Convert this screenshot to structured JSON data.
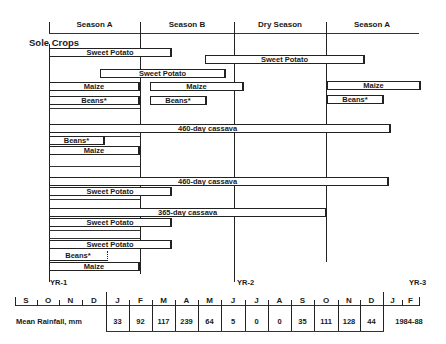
{
  "seasons": [
    {
      "label": "Season A"
    },
    {
      "label": "Season B"
    },
    {
      "label": "Dry Season"
    },
    {
      "label": "Season A"
    }
  ],
  "section_title": "Sole Crops",
  "bars": [
    {
      "label": "Sweet Potato"
    },
    {
      "label": "Sweet Potato"
    },
    {
      "label": "Sweet Potato"
    },
    {
      "label": "Maize"
    },
    {
      "label": "Maize"
    },
    {
      "label": "Maize"
    },
    {
      "label": "Beans*"
    },
    {
      "label": "Beans*"
    },
    {
      "label": "Beans*"
    },
    {
      "label": "460-day cassava"
    },
    {
      "label": "Beans*"
    },
    {
      "label": "Maize"
    },
    {
      "label": "460-day cassava"
    },
    {
      "label": "Sweet Potato"
    },
    {
      "label": "365-day cassava"
    },
    {
      "label": "Sweet Potato"
    },
    {
      "label": "Sweet Potato"
    },
    {
      "label": "Beans*"
    },
    {
      "label": "Maize"
    }
  ],
  "year_labels": {
    "yr1": "YR-1",
    "yr2": "YR-2",
    "yr3": "YR-3"
  },
  "months": [
    "S",
    "O",
    "N",
    "D",
    "J",
    "F",
    "M",
    "A",
    "M",
    "J",
    "J",
    "A",
    "S",
    "O",
    "N",
    "D",
    "J",
    "F"
  ],
  "rainfall": {
    "label": "Mean Rainfall, mm",
    "values": [
      "33",
      "92",
      "117",
      "239",
      "64",
      "5",
      "0",
      "0",
      "35",
      "111",
      "128",
      "44"
    ],
    "period": "1984-88"
  }
}
